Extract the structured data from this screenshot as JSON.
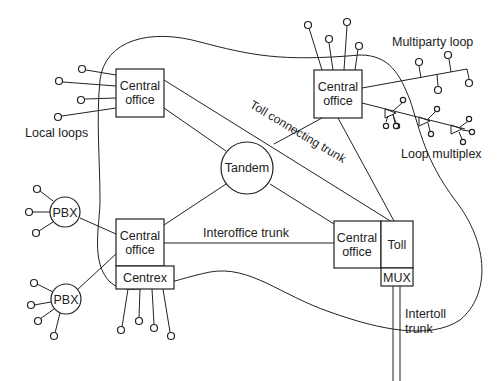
{
  "diagram": {
    "title": "",
    "nodes": {
      "co_top_left": {
        "line1": "Central",
        "line2": "office"
      },
      "co_top_right": {
        "line1": "Central",
        "line2": "office"
      },
      "co_bottom_left": {
        "line1": "Central",
        "line2": "office"
      },
      "co_bottom_right": {
        "line1": "Central",
        "line2": "office"
      },
      "tandem": "Tandem",
      "toll": "Toll",
      "mux": "MUX",
      "centrex": "Centrex",
      "pbx_top": "PBX",
      "pbx_bottom": "PBX"
    },
    "labels": {
      "local_loops": "Local loops",
      "multiparty_loop": "Multiparty loop",
      "loop_multiplex": "Loop multiplex",
      "toll_connecting_trunk": "Toll connecting trunk",
      "interoffice_trunk": "Interoffice trunk",
      "intertoll_line1": "Intertoll",
      "intertoll_line2": "trunk"
    },
    "colors": {
      "stroke": "#222222",
      "background": "#ffffff"
    }
  }
}
